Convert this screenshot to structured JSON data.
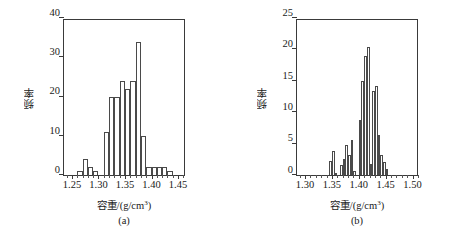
{
  "figure": {
    "type": "histogram-figure",
    "panel_count": 2
  },
  "chart_data": [
    {
      "type": "bar",
      "panel_label": "(a)",
      "title": "",
      "xlabel": "容重/(g/cm³)",
      "ylabel": "频率",
      "xlim": [
        1.235,
        1.465
      ],
      "ylim": [
        0,
        40
      ],
      "ytick_values": [
        0,
        10,
        20,
        30,
        40
      ],
      "ytick_labels": [
        "0",
        "10",
        "20",
        "30",
        "40"
      ],
      "xtick_values": [
        1.25,
        1.3,
        1.35,
        1.4,
        1.45
      ],
      "xtick_labels": [
        "1.25",
        "1.30",
        "1.35",
        "1.40",
        "1.45"
      ],
      "xtick_minor_step": 0.01,
      "bin_width": 0.01,
      "grid": false,
      "legend": false,
      "bin_left_edges": [
        1.26,
        1.27,
        1.28,
        1.29,
        1.31,
        1.32,
        1.33,
        1.34,
        1.35,
        1.36,
        1.37,
        1.38,
        1.39,
        1.4,
        1.41,
        1.42,
        1.43
      ],
      "values": [
        1,
        4,
        2,
        1,
        11,
        20,
        20,
        24,
        22,
        24,
        34,
        10,
        2,
        2,
        2,
        2,
        1
      ]
    },
    {
      "type": "bar",
      "panel_label": "(b)",
      "title": "",
      "xlabel": "容重/(g/cm³)",
      "ylabel": "频率",
      "xlim": [
        1.285,
        1.512
      ],
      "ylim": [
        0,
        25
      ],
      "ytick_values": [
        0,
        5,
        10,
        15,
        20,
        25
      ],
      "ytick_labels": [
        "0",
        "5",
        "10",
        "15",
        "20",
        "25"
      ],
      "xtick_values": [
        1.3,
        1.35,
        1.4,
        1.45,
        1.5
      ],
      "xtick_labels": [
        "1.30",
        "1.35",
        "1.40",
        "1.45",
        "1.50"
      ],
      "xtick_minor_step": 0.01,
      "bin_width": 0.005,
      "grid": false,
      "legend": false,
      "bin_left_edges": [
        1.345,
        1.35,
        1.355,
        1.36,
        1.365,
        1.37,
        1.375,
        1.38,
        1.385,
        1.39,
        1.395,
        1.4,
        1.405,
        1.41,
        1.415,
        1.42,
        1.425,
        1.43,
        1.435,
        1.44,
        1.445,
        1.45,
        1.455,
        1.46,
        1.465,
        1.47,
        1.475,
        1.48,
        1.485
      ],
      "values": [
        2.3,
        3.9,
        0.4,
        0,
        1.6,
        2.5,
        4.8,
        3.2,
        5.6,
        0.6,
        0,
        8.7,
        15.0,
        18.9,
        20.4,
        1.8,
        13.3,
        14.2,
        6.3,
        3.2,
        2.1,
        1.0
      ]
    }
  ]
}
